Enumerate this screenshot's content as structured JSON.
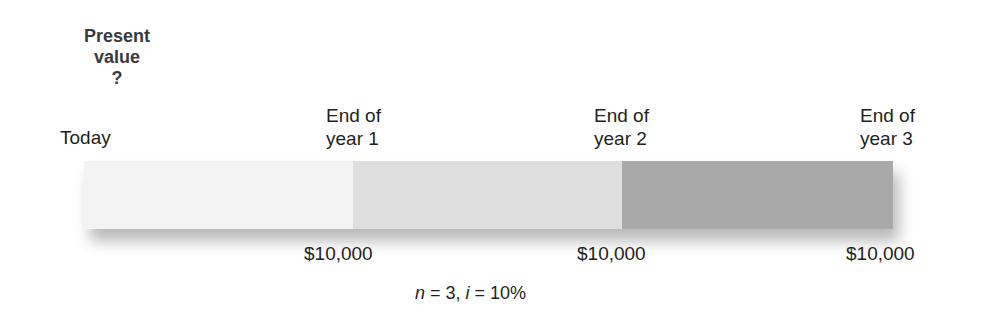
{
  "title": {
    "line1": "Present",
    "line2": "value",
    "line3": "?"
  },
  "timeline": {
    "start_label": "Today",
    "periods": [
      {
        "line1": "End of",
        "line2": "year 1",
        "amount": "$10,000",
        "color": "#dedede"
      },
      {
        "line1": "End of",
        "line2": "year 2",
        "amount": "$10,000",
        "color": "#a9a9a9"
      },
      {
        "line1": "End of",
        "line2": "year 3",
        "amount": "$10,000"
      }
    ],
    "segment_colors": [
      "#f3f3f3",
      "#dedede",
      "#a9a9a9"
    ]
  },
  "formula": {
    "n_var": "n",
    "n_eq": " = 3, ",
    "i_var": "i",
    "i_eq": " = 10%"
  }
}
